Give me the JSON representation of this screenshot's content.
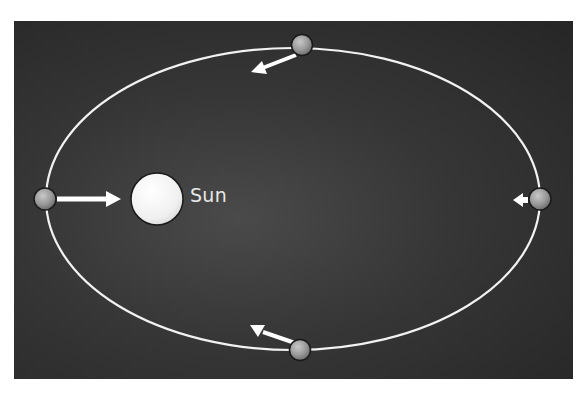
{
  "diagram": {
    "sun": {
      "label": "Sun"
    },
    "orbit": {
      "shape": "ellipse",
      "color": "#f2f2f2"
    },
    "planets": [
      {
        "position": "top",
        "arrow": "down-left (toward Sun)"
      },
      {
        "position": "left (perihelion)",
        "arrow": "right, long (toward Sun)"
      },
      {
        "position": "right (aphelion)",
        "arrow": "left, short (toward Sun)"
      },
      {
        "position": "bottom",
        "arrow": "up-left (toward Sun)"
      }
    ],
    "colors": {
      "background": "#333333",
      "planet": "#9a9a9a",
      "sun": "#f4f4f4",
      "arrow": "#ffffff"
    }
  }
}
